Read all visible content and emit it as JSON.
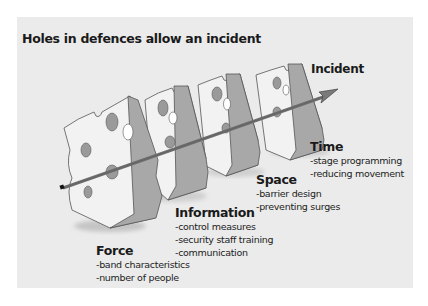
{
  "diagram": {
    "title": "Holes in defences allow an incident",
    "outcome_label": "Incident",
    "layers": [
      {
        "name": "Force",
        "items": [
          "-band characteristics",
          "-number of people"
        ]
      },
      {
        "name": "Information",
        "items": [
          "-control measures",
          "-security staff training",
          "-communication"
        ]
      },
      {
        "name": "Space",
        "items": [
          "-barrier design",
          "-preventing surges"
        ]
      },
      {
        "name": "Time",
        "items": [
          "-stage programming",
          "-reducing movement"
        ]
      }
    ],
    "colors": {
      "panel_background": "#ebebeb",
      "cheese_face": "#f2f2f2",
      "cheese_side": "#a8a8a8",
      "hole": "#9a9a9a",
      "rod": "#6e6e6e",
      "outline": "#555555"
    }
  }
}
